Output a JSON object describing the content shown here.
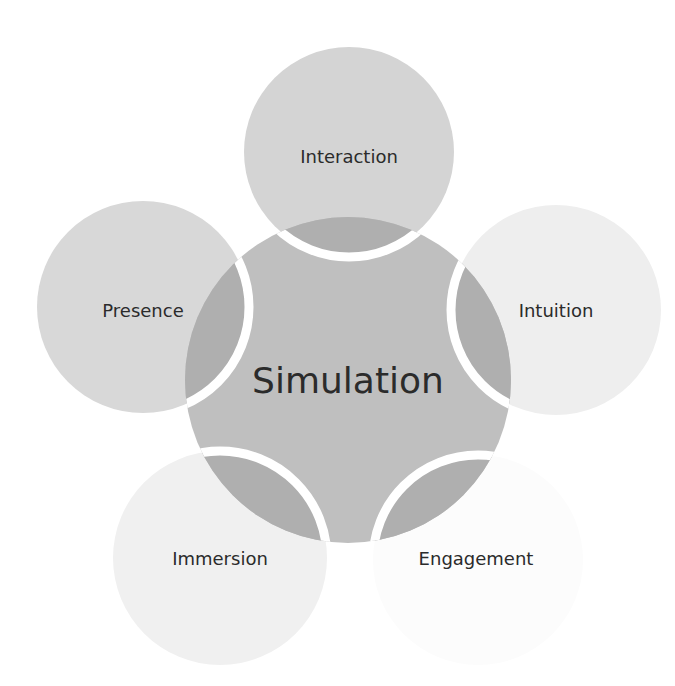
{
  "diagram": {
    "type": "cycle-venn",
    "center": {
      "label": "Simulation",
      "cx": 348,
      "cy": 380,
      "r": 163,
      "fill": "#bfbfbf"
    },
    "overlap_fill": "#afafaf",
    "separator_color": "#ffffff",
    "satellites": [
      {
        "label": "Interaction",
        "cx": 349,
        "cy": 152,
        "r": 105,
        "fill": "#d4d4d4",
        "label_x": 349,
        "label_y": 163
      },
      {
        "label": "Intuition",
        "cx": 556,
        "cy": 310,
        "r": 105,
        "fill": "#eeeeee",
        "label_x": 556,
        "label_y": 317
      },
      {
        "label": "Engagement",
        "cx": 478,
        "cy": 560,
        "r": 105,
        "fill": "#fcfcfc",
        "label_x": 476,
        "label_y": 565
      },
      {
        "label": "Immersion",
        "cx": 220,
        "cy": 558,
        "r": 107,
        "fill": "#f0f0f0",
        "label_x": 220,
        "label_y": 565
      },
      {
        "label": "Presence",
        "cx": 143,
        "cy": 307,
        "r": 106,
        "fill": "#d8d8d8",
        "label_x": 143,
        "label_y": 317
      }
    ]
  }
}
